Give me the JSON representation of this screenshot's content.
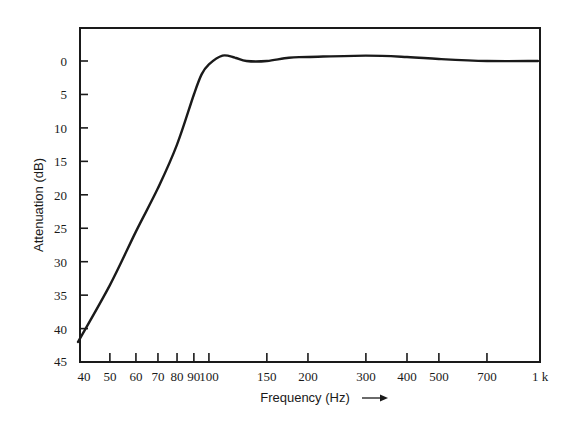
{
  "chart_data": {
    "type": "line",
    "title": "",
    "xlabel": "Frequency (Hz)",
    "xlabel_arrow": "→",
    "ylabel": "Attenuation (dB)",
    "xscale": "log",
    "xlim": [
      40,
      1000
    ],
    "ylim": [
      45,
      -5
    ],
    "y_inverted": true,
    "grid": false,
    "legend": null,
    "x_ticks": [
      40,
      50,
      60,
      70,
      80,
      90,
      100,
      150,
      200,
      300,
      400,
      500,
      700,
      1000
    ],
    "x_tick_labels": [
      "40",
      "50",
      "60",
      "70",
      "80",
      "90",
      "100",
      "150",
      "200",
      "300",
      "400",
      "500",
      "700",
      "1 k"
    ],
    "y_ticks": [
      0,
      5,
      10,
      15,
      20,
      25,
      30,
      35,
      40,
      45
    ],
    "y_tick_labels": [
      "0",
      "5",
      "10",
      "15",
      "20",
      "25",
      "30",
      "35",
      "40",
      "45"
    ],
    "series": [
      {
        "name": "Attenuation",
        "color": "#1a1a1a",
        "x": [
          40,
          50,
          60,
          70,
          80,
          90,
          95,
          100,
          110,
          120,
          130,
          150,
          175,
          200,
          300,
          400,
          500,
          700,
          1000
        ],
        "values": [
          42,
          33.5,
          25.5,
          19,
          12.5,
          5,
          2,
          0.5,
          -0.8,
          -0.5,
          0,
          0,
          -0.5,
          -0.6,
          -0.8,
          -0.6,
          -0.3,
          0,
          0
        ]
      }
    ]
  }
}
